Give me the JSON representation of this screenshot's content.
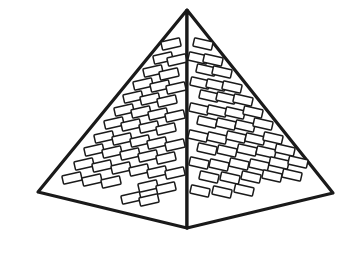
{
  "image": {
    "title": "Pyramid line drawing",
    "subject": "stepped-brick pyramid illustration",
    "width": 354,
    "height": 263,
    "background_color": "#ffffff",
    "stroke_color": "#1a1a1a",
    "fill_color": "#ffffff"
  },
  "geometry": {
    "apex": {
      "x": 187,
      "y": 10
    },
    "left_corner": {
      "x": 38,
      "y": 192
    },
    "right_corner": {
      "x": 333,
      "y": 193
    },
    "front_bottom_vertex": {
      "x": 187,
      "y": 228
    },
    "outline_stroke_width": 3.2,
    "ridge_stroke_width": 1.6,
    "brick_stroke_width": 1.5
  },
  "faces": [
    {
      "name": "left-face",
      "points": "187,10 38,192 187,228",
      "brick_tilt_deg": -13,
      "brick_width": 19,
      "brick_height": 8.5
    },
    {
      "name": "right-face",
      "points": "187,10 333,193 187,228",
      "brick_tilt_deg": 13,
      "brick_width": 19,
      "brick_height": 8.5
    }
  ],
  "bricks": {
    "left": [
      {
        "x": 171,
        "y": 44
      },
      {
        "x": 163,
        "y": 58
      },
      {
        "x": 177,
        "y": 60
      },
      {
        "x": 153,
        "y": 71
      },
      {
        "x": 169,
        "y": 74
      },
      {
        "x": 143,
        "y": 84
      },
      {
        "x": 160,
        "y": 86
      },
      {
        "x": 176,
        "y": 88
      },
      {
        "x": 133,
        "y": 97
      },
      {
        "x": 150,
        "y": 99
      },
      {
        "x": 167,
        "y": 101
      },
      {
        "x": 124,
        "y": 110
      },
      {
        "x": 141,
        "y": 112
      },
      {
        "x": 158,
        "y": 114
      },
      {
        "x": 175,
        "y": 116
      },
      {
        "x": 114,
        "y": 123
      },
      {
        "x": 131,
        "y": 125
      },
      {
        "x": 149,
        "y": 127
      },
      {
        "x": 166,
        "y": 129
      },
      {
        "x": 104,
        "y": 137
      },
      {
        "x": 122,
        "y": 139
      },
      {
        "x": 140,
        "y": 141
      },
      {
        "x": 157,
        "y": 143
      },
      {
        "x": 175,
        "y": 145
      },
      {
        "x": 94,
        "y": 150
      },
      {
        "x": 112,
        "y": 152
      },
      {
        "x": 130,
        "y": 154
      },
      {
        "x": 148,
        "y": 156
      },
      {
        "x": 166,
        "y": 158
      },
      {
        "x": 84,
        "y": 164
      },
      {
        "x": 102,
        "y": 166
      },
      {
        "x": 121,
        "y": 168
      },
      {
        "x": 139,
        "y": 170
      },
      {
        "x": 157,
        "y": 172
      },
      {
        "x": 175,
        "y": 173
      },
      {
        "x": 72,
        "y": 178
      },
      {
        "x": 92,
        "y": 180
      },
      {
        "x": 111,
        "y": 182
      },
      {
        "x": 148,
        "y": 186
      },
      {
        "x": 166,
        "y": 188
      },
      {
        "x": 131,
        "y": 198
      },
      {
        "x": 149,
        "y": 200
      }
    ],
    "right": [
      {
        "x": 203,
        "y": 44
      },
      {
        "x": 198,
        "y": 58
      },
      {
        "x": 213,
        "y": 60
      },
      {
        "x": 206,
        "y": 70
      },
      {
        "x": 222,
        "y": 72
      },
      {
        "x": 200,
        "y": 83
      },
      {
        "x": 216,
        "y": 85
      },
      {
        "x": 232,
        "y": 87
      },
      {
        "x": 209,
        "y": 96
      },
      {
        "x": 226,
        "y": 98
      },
      {
        "x": 243,
        "y": 100
      },
      {
        "x": 199,
        "y": 109
      },
      {
        "x": 217,
        "y": 111
      },
      {
        "x": 235,
        "y": 113
      },
      {
        "x": 253,
        "y": 112
      },
      {
        "x": 207,
        "y": 122
      },
      {
        "x": 226,
        "y": 124
      },
      {
        "x": 245,
        "y": 126
      },
      {
        "x": 263,
        "y": 124
      },
      {
        "x": 198,
        "y": 136
      },
      {
        "x": 217,
        "y": 138
      },
      {
        "x": 236,
        "y": 137
      },
      {
        "x": 255,
        "y": 139
      },
      {
        "x": 273,
        "y": 138
      },
      {
        "x": 207,
        "y": 149
      },
      {
        "x": 227,
        "y": 151
      },
      {
        "x": 247,
        "y": 150
      },
      {
        "x": 266,
        "y": 152
      },
      {
        "x": 285,
        "y": 150
      },
      {
        "x": 199,
        "y": 163
      },
      {
        "x": 219,
        "y": 165
      },
      {
        "x": 239,
        "y": 164
      },
      {
        "x": 259,
        "y": 165
      },
      {
        "x": 279,
        "y": 163
      },
      {
        "x": 298,
        "y": 162
      },
      {
        "x": 209,
        "y": 177
      },
      {
        "x": 230,
        "y": 178
      },
      {
        "x": 251,
        "y": 177
      },
      {
        "x": 272,
        "y": 176
      },
      {
        "x": 292,
        "y": 175
      },
      {
        "x": 200,
        "y": 191
      },
      {
        "x": 222,
        "y": 192
      },
      {
        "x": 244,
        "y": 190
      }
    ]
  }
}
